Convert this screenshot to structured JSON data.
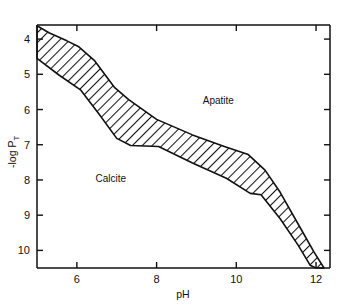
{
  "chart_data": {
    "type": "area",
    "title": "",
    "subtitle": "",
    "xlabel": "pH",
    "ylabel": "-log P",
    "ylabel_subscript": "T",
    "xlim": [
      5.0,
      12.35
    ],
    "ylim": [
      10.5,
      3.6
    ],
    "y_axis_inverted": true,
    "grid": false,
    "legend": "none",
    "x_ticks": [
      6,
      8,
      10,
      12
    ],
    "x_tick_labels": [
      "6",
      "8",
      "10",
      "12"
    ],
    "x_minor_ticks": [],
    "y_ticks": [
      4,
      5,
      6,
      7,
      8,
      9,
      10
    ],
    "y_tick_labels": [
      "4",
      "5",
      "6",
      "7",
      "8",
      "9",
      "10"
    ],
    "ticks_on_all_sides": true,
    "tick_direction": "inward",
    "annotations": [
      {
        "text": "Apatite",
        "x": 9.55,
        "y": 5.85
      },
      {
        "text": "Calcite",
        "x": 6.85,
        "y": 8.05
      }
    ],
    "band": {
      "name": "calcite-apatite equilibrium band",
      "fill": "diagonal-hatch",
      "hatch_angle_deg": 45,
      "upper_boundary": {
        "name": "apatite side boundary",
        "points": [
          [
            5.0,
            3.62
          ],
          [
            5.3,
            3.82
          ],
          [
            5.75,
            4.05
          ],
          [
            6.05,
            4.22
          ],
          [
            6.45,
            4.62
          ],
          [
            6.95,
            5.38
          ],
          [
            7.3,
            5.72
          ],
          [
            8.0,
            6.28
          ],
          [
            8.9,
            6.72
          ],
          [
            9.7,
            7.05
          ],
          [
            10.3,
            7.28
          ],
          [
            10.72,
            7.72
          ],
          [
            11.1,
            8.35
          ],
          [
            11.6,
            9.35
          ],
          [
            11.95,
            10.05
          ],
          [
            12.2,
            10.5
          ]
        ]
      },
      "lower_boundary": {
        "name": "calcite side boundary",
        "points": [
          [
            5.0,
            4.55
          ],
          [
            5.55,
            5.02
          ],
          [
            6.1,
            5.45
          ],
          [
            6.55,
            6.12
          ],
          [
            7.0,
            6.82
          ],
          [
            7.35,
            7.02
          ],
          [
            8.05,
            7.05
          ],
          [
            8.9,
            7.52
          ],
          [
            9.75,
            7.95
          ],
          [
            10.35,
            8.38
          ],
          [
            10.62,
            8.42
          ],
          [
            11.1,
            9.1
          ],
          [
            11.55,
            9.85
          ],
          [
            11.85,
            10.42
          ],
          [
            12.0,
            10.5
          ]
        ]
      }
    }
  },
  "colors": {
    "axis": "#111111",
    "band_stroke": "#111111",
    "hatch": "#111111",
    "background": "#ffffff"
  }
}
